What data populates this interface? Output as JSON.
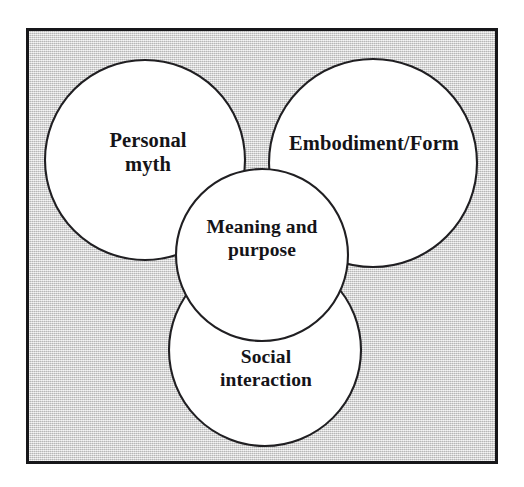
{
  "diagram": {
    "type": "venn-three-circle-with-core",
    "title_visible": false,
    "frame": {
      "border_color": "#17171a",
      "background_color": "#d2d2d2",
      "background_texture": "dithered-gray-halftone"
    },
    "circle_style": {
      "fill_color": "#ffffff",
      "stroke_color": "#201f22"
    },
    "text_color": "#151418",
    "circles": [
      {
        "id": "personal-myth",
        "label": "Personal\nmyth",
        "label_lines": [
          "Personal",
          "myth"
        ],
        "cx": 145,
        "cy": 160,
        "r": 100,
        "position": "top-left"
      },
      {
        "id": "embodiment-form",
        "label": "Embodiment/Form",
        "label_lines": [
          "Embodiment/Form"
        ],
        "cx": 373,
        "cy": 163,
        "r": 104,
        "position": "top-right"
      },
      {
        "id": "social-interaction",
        "label": "Social\ninteraction",
        "label_lines": [
          "Social",
          "interaction"
        ],
        "cx": 265,
        "cy": 350,
        "r": 96,
        "position": "bottom-center"
      },
      {
        "id": "meaning-purpose",
        "label": "Meaning and\npurpose",
        "label_lines": [
          "Meaning and",
          "purpose"
        ],
        "cx": 262,
        "cy": 255,
        "r": 86,
        "position": "center-core"
      }
    ]
  }
}
